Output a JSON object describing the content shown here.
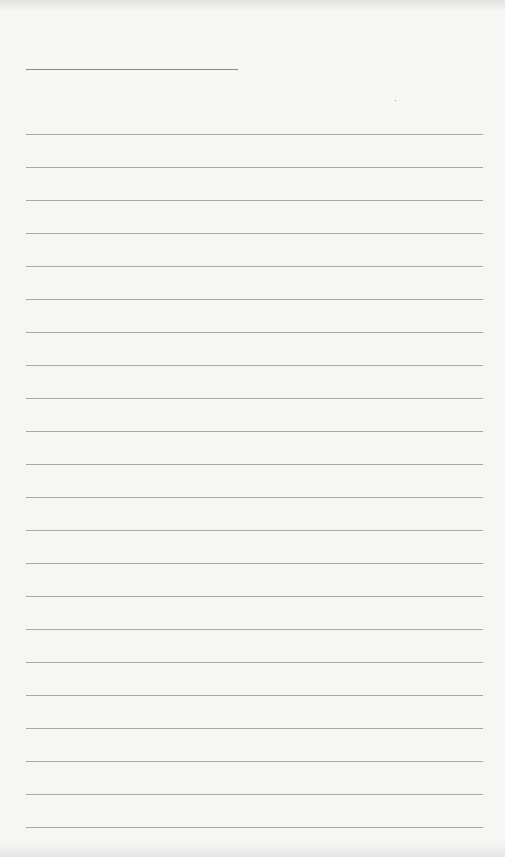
{
  "page": {
    "type": "lined-paper",
    "title_line": {
      "x": 26,
      "y": 69,
      "width": 212
    },
    "rules": {
      "count": 22,
      "start_y": 134,
      "spacing": 33,
      "x": 26,
      "width": 457
    },
    "colors": {
      "paper": "#f6f6f4",
      "rule": "#a9a9a7",
      "title_rule": "#8a8a88"
    }
  }
}
